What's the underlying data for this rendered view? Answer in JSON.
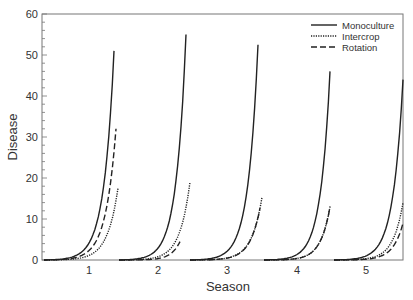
{
  "chart_data": {
    "type": "line",
    "title": "",
    "xlabel": "Season",
    "ylabel": "Disease",
    "ylim": [
      0,
      60
    ],
    "yticks": [
      0,
      10,
      20,
      30,
      40,
      50,
      60
    ],
    "xticks": [
      "1",
      "2",
      "3",
      "4",
      "5"
    ],
    "grid": false,
    "legend_position": "upper right",
    "colors": {
      "line": "#222222",
      "axis": "#666666",
      "text": "#333333"
    },
    "categories": [
      "1",
      "2",
      "3",
      "4",
      "5"
    ],
    "series": [
      {
        "name": "Monoculture",
        "style": "solid",
        "values": [
          51,
          55,
          52.5,
          46,
          44
        ]
      },
      {
        "name": "Intercrop",
        "style": "dotted",
        "values": [
          17.5,
          19,
          15.3,
          13,
          14
        ]
      },
      {
        "name": "Rotation",
        "style": "dashed",
        "values": [
          32,
          4.5,
          12.7,
          13,
          9
        ]
      }
    ]
  },
  "legend": {
    "items": [
      {
        "label": "Monoculture",
        "style": "solid"
      },
      {
        "label": "Intercrop",
        "style": "dotted"
      },
      {
        "label": "Rotation",
        "style": "dashed"
      }
    ]
  },
  "axes": {
    "x_title": "Season",
    "y_title": "Disease",
    "y_tick_labels": [
      "0",
      "10",
      "20",
      "30",
      "40",
      "50",
      "60"
    ],
    "x_tick_labels": [
      "1",
      "2",
      "3",
      "4",
      "5"
    ]
  }
}
